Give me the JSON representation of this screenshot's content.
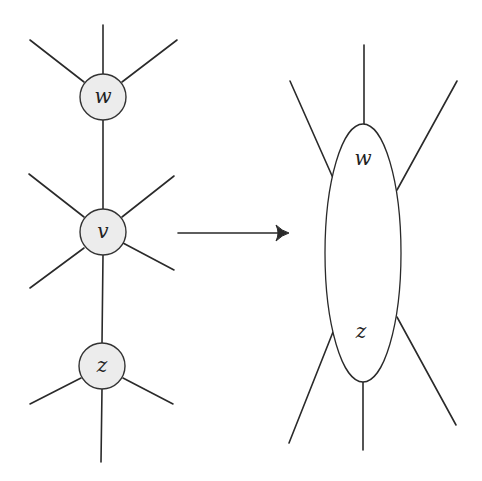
{
  "diagram": {
    "left_graph": {
      "nodes": [
        {
          "id": "w",
          "label": "w",
          "cx": 103,
          "cy": 97,
          "r": 23
        },
        {
          "id": "v",
          "label": "v",
          "cx": 103,
          "cy": 232,
          "r": 23
        },
        {
          "id": "z",
          "label": "z",
          "cx": 102,
          "cy": 366,
          "r": 23
        }
      ]
    },
    "arrow": {
      "from": [
        178,
        233
      ],
      "to": [
        288,
        233
      ]
    },
    "right_graph": {
      "merged_node": {
        "cx": 363,
        "cy": 253,
        "rx": 38,
        "ry": 130
      },
      "labels": [
        {
          "id": "w",
          "label": "w",
          "x": 363,
          "y": 165
        },
        {
          "id": "z",
          "label": "z",
          "x": 361,
          "y": 338
        }
      ]
    },
    "colors": {
      "node_fill": "#ececec",
      "stroke": "#2a2a2a",
      "background": "#ffffff"
    }
  }
}
